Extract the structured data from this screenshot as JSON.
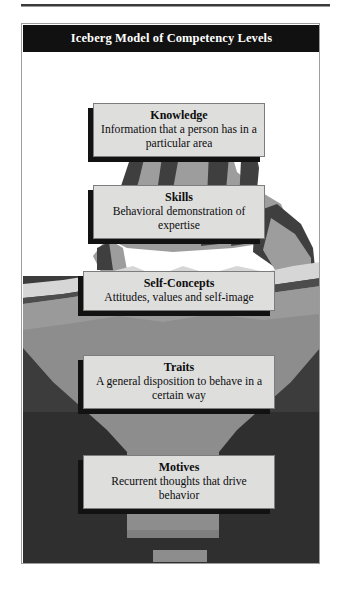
{
  "figure": {
    "title": "Iceberg Model of Competency Levels",
    "top_rule": "horizontal-rule",
    "colors": {
      "banner_background": "#111111",
      "banner_text": "#ffffff",
      "box_fill": "#dededd",
      "box_border": "#7d7d7d",
      "box_shadow": "#121212",
      "iceberg_above_light": "#9d9d9d",
      "iceberg_above_dark": "#3f3f3f",
      "iceberg_below": "#8d8d8d",
      "water_dark": "#4a4a4a",
      "water_deep": "#2d2d2d",
      "whitecap": "#d6d6d6",
      "sky": "#ffffff"
    }
  },
  "levels": [
    {
      "id": "knowledge",
      "title": "Knowledge",
      "description": "Information that a person has in a particular area",
      "position": "above-water"
    },
    {
      "id": "skills",
      "title": "Skills",
      "description": "Behavioral demonstration of expertise",
      "position": "above-water"
    },
    {
      "id": "self-concepts",
      "title": "Self-Concepts",
      "description": "Attitudes, values and self-image",
      "position": "below-water"
    },
    {
      "id": "traits",
      "title": "Traits",
      "description": "A general disposition to behave in a certain way",
      "position": "below-water"
    },
    {
      "id": "motives",
      "title": "Motives",
      "description": "Recurrent thoughts that drive behavior",
      "position": "below-water"
    }
  ]
}
